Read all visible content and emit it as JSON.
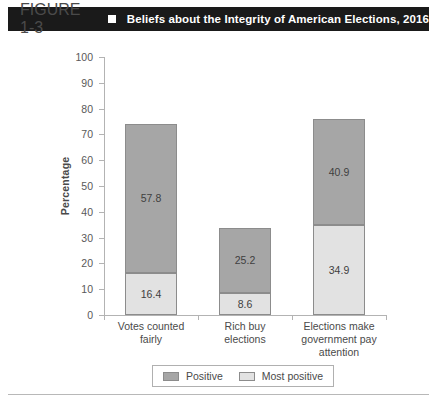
{
  "header": {
    "figure_number": "FIGURE 1-3",
    "bullet": "square-bullet",
    "title": "Beliefs about the Integrity of American Elections, 2016",
    "bar_color": "#1a1a1a",
    "text_color": "#ffffff"
  },
  "legend": {
    "position": "bottom-center",
    "items": [
      {
        "label": "Positive",
        "color": "#a6a6a6"
      },
      {
        "label": "Most positive",
        "color": "#e2e2e2"
      }
    ]
  },
  "chart_data": {
    "type": "bar",
    "stacked": true,
    "title": "Beliefs about the Integrity of American Elections, 2016",
    "xlabel": "",
    "ylabel": "Percentage",
    "ylim": [
      0,
      100
    ],
    "yticks": [
      0,
      10,
      20,
      30,
      40,
      50,
      60,
      70,
      80,
      90,
      100
    ],
    "ytick_labels": [
      "0",
      "10",
      "20",
      "30",
      "40",
      "50",
      "60",
      "70",
      "80",
      "90",
      "100"
    ],
    "grid": false,
    "legend_position": "bottom-center",
    "categories": [
      "Votes counted fairly",
      "Rich buy elections",
      "Elections make government pay attention"
    ],
    "category_label_lines": [
      [
        "Votes counted",
        "fairly"
      ],
      [
        "Rich buy",
        "elections"
      ],
      [
        "Elections make",
        "government pay",
        "attention"
      ]
    ],
    "series": [
      {
        "name": "Most positive",
        "color": "#e2e2e2",
        "values": [
          16.4,
          8.6,
          34.9
        ],
        "labels": [
          "16.4",
          "8.6",
          "34.9"
        ]
      },
      {
        "name": "Positive",
        "color": "#a6a6a6",
        "values": [
          57.8,
          25.2,
          40.9
        ],
        "labels": [
          "57.8",
          "25.2",
          "40.9"
        ]
      }
    ],
    "totals": [
      74.2,
      33.8,
      75.8
    ]
  }
}
